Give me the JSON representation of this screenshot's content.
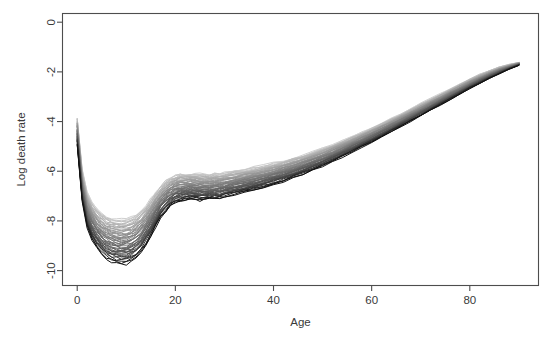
{
  "figure": {
    "background_color": "#ffffff",
    "axis_color": "#4d4d4d",
    "text_color": "#3a3a3a"
  },
  "chart_data": {
    "type": "line",
    "title": "",
    "subtitle": "",
    "xlabel": "Age",
    "ylabel": "Log death rate",
    "xlim": [
      -3,
      94
    ],
    "ylim": [
      -10.6,
      0.35
    ],
    "xticks": [
      0,
      20,
      40,
      60,
      80
    ],
    "yticks": [
      0,
      -2,
      -4,
      -6,
      -8,
      -10
    ],
    "xtick_labels": [
      "0",
      "20",
      "40",
      "60",
      "80"
    ],
    "ytick_labels": [
      "0",
      "-2",
      "-4",
      "-6",
      "-8",
      "-10"
    ],
    "grid": false,
    "legend": false,
    "legend_position": "none",
    "annotations": [],
    "x": [
      0,
      1,
      2,
      3,
      4,
      5,
      6,
      7,
      8,
      9,
      10,
      11,
      12,
      13,
      14,
      15,
      16,
      17,
      18,
      19,
      20,
      21,
      22,
      23,
      24,
      25,
      26,
      27,
      28,
      29,
      30,
      32,
      34,
      36,
      38,
      40,
      42,
      44,
      46,
      48,
      50,
      52,
      54,
      56,
      58,
      60,
      62,
      64,
      66,
      68,
      70,
      72,
      74,
      76,
      78,
      80,
      82,
      84,
      86,
      88,
      90
    ],
    "band": {
      "upper": [
        -3.85,
        -5.95,
        -6.85,
        -7.25,
        -7.52,
        -7.7,
        -7.82,
        -7.9,
        -7.94,
        -7.95,
        -7.92,
        -7.85,
        -7.74,
        -7.58,
        -7.38,
        -7.12,
        -6.84,
        -6.58,
        -6.38,
        -6.24,
        -6.16,
        -6.12,
        -6.1,
        -6.1,
        -6.11,
        -6.12,
        -6.12,
        -6.12,
        -6.11,
        -6.09,
        -6.06,
        -5.99,
        -5.92,
        -5.85,
        -5.77,
        -5.68,
        -5.58,
        -5.47,
        -5.35,
        -5.22,
        -5.08,
        -4.93,
        -4.77,
        -4.6,
        -4.43,
        -4.25,
        -4.06,
        -3.87,
        -3.68,
        -3.48,
        -3.28,
        -3.08,
        -2.88,
        -2.68,
        -2.48,
        -2.28,
        -2.1,
        -1.94,
        -1.8,
        -1.7,
        -1.62
      ],
      "lower": [
        -4.95,
        -7.2,
        -8.25,
        -8.75,
        -9.1,
        -9.35,
        -9.52,
        -9.64,
        -9.72,
        -9.76,
        -9.74,
        -9.66,
        -9.52,
        -9.3,
        -9.0,
        -8.64,
        -8.26,
        -7.92,
        -7.64,
        -7.44,
        -7.3,
        -7.22,
        -7.18,
        -7.16,
        -7.16,
        -7.16,
        -7.16,
        -7.15,
        -7.13,
        -7.1,
        -7.06,
        -6.97,
        -6.88,
        -6.78,
        -6.67,
        -6.55,
        -6.42,
        -6.28,
        -6.13,
        -5.97,
        -5.8,
        -5.62,
        -5.43,
        -5.24,
        -5.04,
        -4.84,
        -4.63,
        -4.42,
        -4.21,
        -4.0,
        -3.78,
        -3.56,
        -3.34,
        -3.12,
        -2.9,
        -2.68,
        -2.47,
        -2.27,
        -2.08,
        -1.9,
        -1.74
      ]
    },
    "n_series": 48,
    "series_color_range": [
      "#0a0a0a",
      "#d8d8d8"
    ],
    "series": [
      {
        "name": "curve-1",
        "shade": "#111111",
        "offset": 0.0
      },
      {
        "name": "curve-2",
        "shade": "#cfcfcf",
        "offset": 1.0
      },
      {
        "name": "curve-3",
        "shade": "#c6c6c6",
        "offset": 0.96
      },
      {
        "name": "curve-4",
        "shade": "#bebebe",
        "offset": 0.92
      },
      {
        "name": "curve-5",
        "shade": "#b6b6b6",
        "offset": 0.88
      },
      {
        "name": "curve-6",
        "shade": "#afafaf",
        "offset": 0.84
      },
      {
        "name": "curve-7",
        "shade": "#a8a8a8",
        "offset": 0.8
      },
      {
        "name": "curve-8",
        "shade": "#a1a1a1",
        "offset": 0.76
      },
      {
        "name": "curve-9",
        "shade": "#9a9a9a",
        "offset": 0.72
      },
      {
        "name": "curve-10",
        "shade": "#949494",
        "offset": 0.68
      },
      {
        "name": "curve-11",
        "shade": "#8e8e8e",
        "offset": 0.64
      },
      {
        "name": "curve-12",
        "shade": "#888888",
        "offset": 0.6
      },
      {
        "name": "curve-13",
        "shade": "#828282",
        "offset": 0.56
      },
      {
        "name": "curve-14",
        "shade": "#7c7c7c",
        "offset": 0.52
      },
      {
        "name": "curve-15",
        "shade": "#767676",
        "offset": 0.48
      },
      {
        "name": "curve-16",
        "shade": "#707070",
        "offset": 0.44
      },
      {
        "name": "curve-17",
        "shade": "#6a6a6a",
        "offset": 0.4
      },
      {
        "name": "curve-18",
        "shade": "#646464",
        "offset": 0.36
      },
      {
        "name": "curve-19",
        "shade": "#5e5e5e",
        "offset": 0.32
      },
      {
        "name": "curve-20",
        "shade": "#585858",
        "offset": 0.28
      },
      {
        "name": "curve-21",
        "shade": "#515151",
        "offset": 0.24
      },
      {
        "name": "curve-22",
        "shade": "#4a4a4a",
        "offset": 0.2
      },
      {
        "name": "curve-23",
        "shade": "#3f3f3f",
        "offset": 0.16
      },
      {
        "name": "curve-24",
        "shade": "#333333",
        "offset": 0.12
      },
      {
        "name": "curve-25",
        "shade": "#242424",
        "offset": 0.08
      },
      {
        "name": "curve-26",
        "shade": "#141414",
        "offset": 0.04
      },
      {
        "name": "curve-27",
        "shade": "#d4d4d4",
        "offset": 0.98
      },
      {
        "name": "curve-28",
        "shade": "#c2c2c2",
        "offset": 0.94
      },
      {
        "name": "curve-29",
        "shade": "#bababa",
        "offset": 0.9
      },
      {
        "name": "curve-30",
        "shade": "#b2b2b2",
        "offset": 0.86
      },
      {
        "name": "curve-31",
        "shade": "#ababab",
        "offset": 0.82
      },
      {
        "name": "curve-32",
        "shade": "#a4a4a4",
        "offset": 0.78
      },
      {
        "name": "curve-33",
        "shade": "#9d9d9d",
        "offset": 0.74
      },
      {
        "name": "curve-34",
        "shade": "#979797",
        "offset": 0.7
      },
      {
        "name": "curve-35",
        "shade": "#919191",
        "offset": 0.66
      },
      {
        "name": "curve-36",
        "shade": "#8b8b8b",
        "offset": 0.62
      },
      {
        "name": "curve-37",
        "shade": "#858585",
        "offset": 0.58
      },
      {
        "name": "curve-38",
        "shade": "#7f7f7f",
        "offset": 0.54
      },
      {
        "name": "curve-39",
        "shade": "#797979",
        "offset": 0.5
      },
      {
        "name": "curve-40",
        "shade": "#737373",
        "offset": 0.46
      },
      {
        "name": "curve-41",
        "shade": "#6d6d6d",
        "offset": 0.42
      },
      {
        "name": "curve-42",
        "shade": "#676767",
        "offset": 0.38
      },
      {
        "name": "curve-43",
        "shade": "#616161",
        "offset": 0.34
      },
      {
        "name": "curve-44",
        "shade": "#5b5b5b",
        "offset": 0.3
      },
      {
        "name": "curve-45",
        "shade": "#555555",
        "offset": 0.26
      },
      {
        "name": "curve-46",
        "shade": "#4e4e4e",
        "offset": 0.22
      },
      {
        "name": "curve-47",
        "shade": "#454545",
        "offset": 0.18
      },
      {
        "name": "curve-48",
        "shade": "#2c2c2c",
        "offset": 0.1
      }
    ]
  }
}
